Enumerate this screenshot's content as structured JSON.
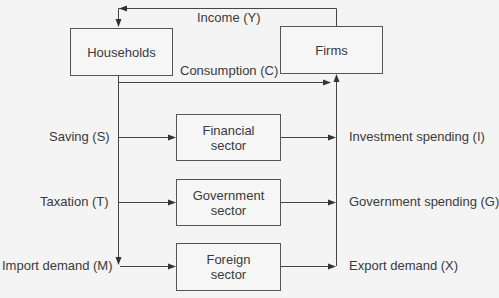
{
  "nodes": {
    "households": "Households",
    "firms": "Firms",
    "financial": "Financial sector",
    "financial_line1": "Financial",
    "financial_line2": "sector",
    "government_line1": "Government",
    "government_line2": "sector",
    "foreign_line1": "Foreign",
    "foreign_line2": "sector"
  },
  "flows": {
    "income": "Income (Y)",
    "consumption": "Consumption (C)",
    "saving": "Saving (S)",
    "taxation": "Taxation (T)",
    "import": "Import demand (M)",
    "investment": "Investment spending (I)",
    "government_spending": "Government spending (G)",
    "export": "Export demand (X)"
  },
  "edges": [
    {
      "from": "Firms",
      "to": "Households",
      "label": "Income (Y)"
    },
    {
      "from": "Households",
      "to": "Firms",
      "label": "Consumption (C)"
    },
    {
      "from": "Households",
      "to": "Financial sector",
      "label": "Saving (S)"
    },
    {
      "from": "Households",
      "to": "Government sector",
      "label": "Taxation (T)"
    },
    {
      "from": "Households",
      "to": "Foreign sector",
      "label": "Import demand (M)"
    },
    {
      "from": "Financial sector",
      "to": "Firms",
      "label": "Investment spending (I)"
    },
    {
      "from": "Government sector",
      "to": "Firms",
      "label": "Government spending (G)"
    },
    {
      "from": "Foreign sector",
      "to": "Firms",
      "label": "Export demand (X)"
    }
  ],
  "colors": {
    "line": "#444444",
    "background": "#f4f4f4",
    "text": "#3a3a3a"
  }
}
